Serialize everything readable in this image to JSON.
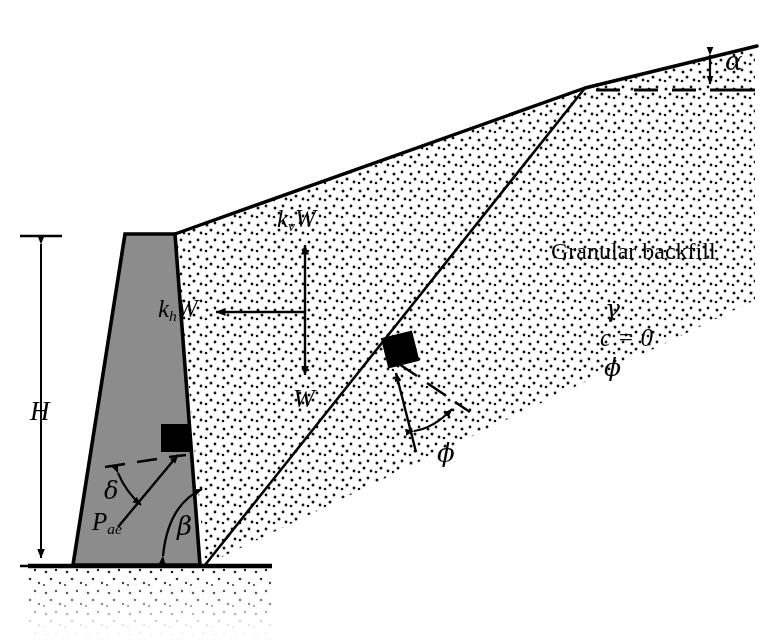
{
  "figure": {
    "background_color": "#ffffff",
    "line_color": "#000000",
    "wall_fill_color": "#8c8c8c",
    "marker_color": "#000000"
  },
  "labels": {
    "height_dimension": "H",
    "vertical_inertia_force": "k",
    "vertical_inertia_subscript": "v",
    "vertical_inertia_suffix": "W",
    "horizontal_inertia_force": "k",
    "horizontal_inertia_subscript": "h",
    "horizontal_inertia_suffix": "W",
    "weight": "W",
    "active_thrust": "P",
    "active_thrust_subscript": "ae",
    "wall_friction_angle": "δ",
    "wall_back_face_angle": "β",
    "backfill_slope_angle": "α",
    "soil_friction_angle": "ϕ",
    "backfill_title": "Granular backfill",
    "unit_weight": "γ",
    "cohesion": "c = 0",
    "friction_angle": "ϕ"
  },
  "elements": {
    "wall": "gravity-retaining-wall",
    "backfill": "granular-backfill-wedge",
    "foundation": "foundation-soil",
    "failure_plane": "failure-surface",
    "ground_line": "ground-surface-line",
    "backfill_surface": "sloping-backfill-surface",
    "alpha_reference": "horizontal-dashed-reference-line",
    "delta_reference": "horizontal-dashed-line-at-wall-back",
    "phi_reference": "dashed-normal-to-failure-plane"
  },
  "geometry": {
    "wall_top_left_x": 125,
    "wall_top_right_x": 175,
    "wall_top_y": 234,
    "wall_base_left_x": 73,
    "wall_base_right_x": 200,
    "ground_line_y": 565,
    "backfill_apex_x": 585,
    "backfill_apex_y": 88,
    "slope_end_x": 755,
    "slope_end_y": 46,
    "failure_plane_base_x": 205,
    "alpha_dash_y": 90
  }
}
